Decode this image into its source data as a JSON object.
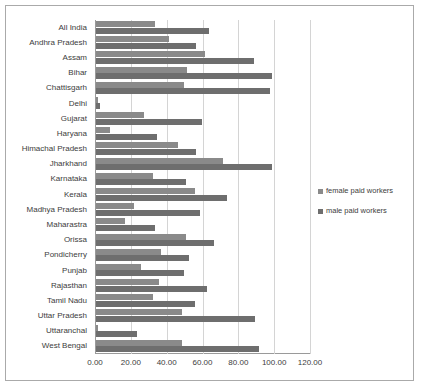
{
  "chart_data": {
    "type": "bar",
    "orientation": "horizontal",
    "title": "",
    "xlabel": "",
    "ylabel": "",
    "xlim": [
      0,
      120
    ],
    "xticks": [
      "0.00",
      "20.00",
      "40.00",
      "60.00",
      "80.00",
      "100.00",
      "120.00"
    ],
    "grid": true,
    "legend_position": "right",
    "categories": [
      "All India",
      "Andhra Pradesh",
      "Assam",
      "Bihar",
      "Chattisgarh",
      "Delhi",
      "Gujarat",
      "Haryana",
      "Himachal Pradesh",
      "Jharkhand",
      "Karnataka",
      "Kerala",
      "Madhya Pradesh",
      "Maharastra",
      "Orissa",
      "Pondicherry",
      "Punjab",
      "Rajasthan",
      "Tamil Nadu",
      "Uttar Pradesh",
      "Uttaranchal",
      "West Bengal"
    ],
    "series": [
      {
        "name": "female paid workers",
        "color": "#8a8a8a",
        "values": [
          33,
          41,
          61,
          51,
          49,
          1,
          27,
          8,
          46,
          71,
          32,
          55,
          21,
          16,
          50,
          36,
          25,
          35,
          32,
          48,
          1,
          48
        ]
      },
      {
        "name": "male paid workers",
        "color": "#6e6e6e",
        "values": [
          63,
          56,
          88,
          98,
          97,
          2,
          59,
          34,
          56,
          98,
          50,
          73,
          58,
          33,
          66,
          52,
          49,
          62,
          55,
          89,
          23,
          91
        ]
      }
    ]
  },
  "legend": {
    "items": [
      {
        "label": "female paid workers",
        "color": "#8a8a8a"
      },
      {
        "label": "male paid workers",
        "color": "#6e6e6e"
      }
    ]
  }
}
